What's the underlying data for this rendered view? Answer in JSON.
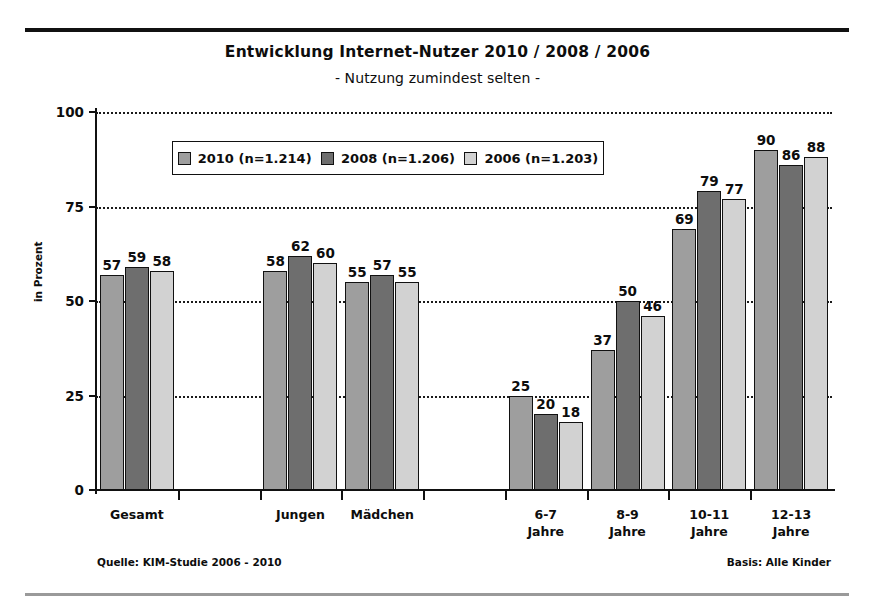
{
  "chart_data": {
    "type": "bar",
    "title": "Entwicklung Internet-Nutzer 2010 / 2008 / 2006",
    "subtitle": "- Nutzung zumindest selten -",
    "xlabel": "",
    "ylabel": "in Prozent",
    "ylim": [
      0,
      100
    ],
    "yticks": [
      0,
      25,
      50,
      75,
      100
    ],
    "grid": true,
    "legend_position": "top-center",
    "categories": [
      "Gesamt",
      "Jungen",
      "Mädchen",
      "6-7\nJahre",
      "8-9\nJahre",
      "10-11\nJahre",
      "12-13\nJahre"
    ],
    "series": [
      {
        "name": "2010 (n=1.214)",
        "color": "#9e9e9e",
        "values": [
          57,
          58,
          55,
          25,
          37,
          69,
          90
        ]
      },
      {
        "name": "2008 (n=1.206)",
        "color": "#6e6e6e",
        "values": [
          59,
          62,
          57,
          20,
          50,
          79,
          86
        ]
      },
      {
        "name": "2006 (n=1.203)",
        "color": "#d2d2d2",
        "values": [
          58,
          60,
          55,
          18,
          46,
          77,
          88
        ]
      }
    ],
    "source": "Quelle: KIM-Studie 2006 - 2010",
    "basis": "Basis: Alle Kinder"
  }
}
